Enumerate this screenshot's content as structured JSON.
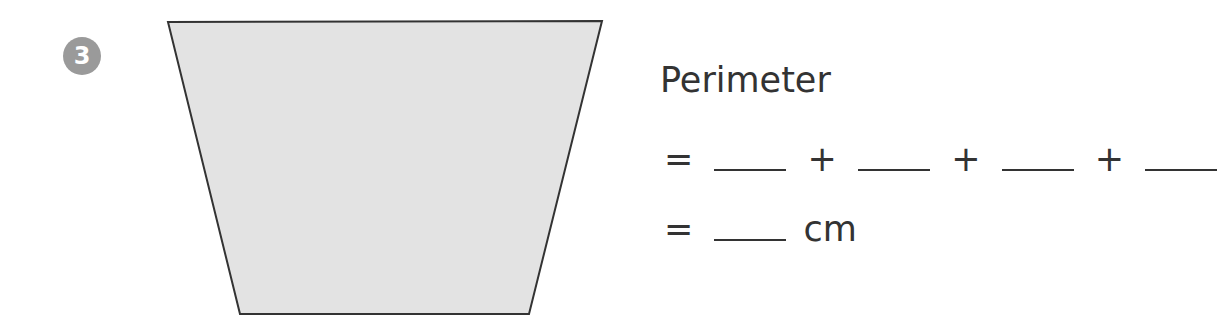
{
  "question": {
    "number": "3",
    "badge_color": "#9a9a9a"
  },
  "shape": {
    "type": "trapezoid",
    "fill": "#e3e3e3",
    "stroke": "#333333",
    "points": "168,22 602,21 529,314 240,314"
  },
  "formula": {
    "label": "Perimeter",
    "line2": {
      "equals": "=",
      "plus": "+"
    },
    "line3": {
      "equals": "=",
      "unit": "cm"
    }
  }
}
